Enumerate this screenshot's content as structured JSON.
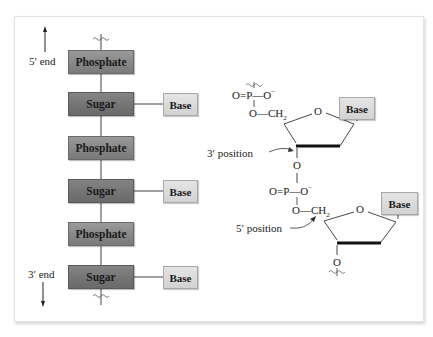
{
  "diagram": {
    "left_panel": {
      "end_labels": {
        "top": "5′ end",
        "bottom": "3′ end"
      },
      "units": [
        {
          "type": "phosphate",
          "label": "Phosphate"
        },
        {
          "type": "sugar",
          "label": "Sugar",
          "base": "Base"
        },
        {
          "type": "phosphate",
          "label": "Phosphate"
        },
        {
          "type": "sugar",
          "label": "Sugar",
          "base": "Base"
        },
        {
          "type": "phosphate",
          "label": "Phosphate"
        },
        {
          "type": "sugar",
          "label": "Sugar",
          "base": "Base"
        }
      ]
    },
    "right_panel": {
      "nucleotide_1": {
        "phosphate": {
          "double_o": "O",
          "p": "P",
          "o_minus": "O",
          "minus": "−"
        },
        "linker_o": "O",
        "ch2": "CH",
        "ch2_sub": "2",
        "ring_o": "O",
        "base": "Base",
        "three_prime_o": "O"
      },
      "nucleotide_2": {
        "phosphate": {
          "double_o": "O",
          "p": "P",
          "o_minus": "O",
          "minus": "−"
        },
        "linker_o": "O",
        "ch2": "CH",
        "ch2_sub": "2",
        "ring_o": "O",
        "base": "Base",
        "three_prime_o": "O"
      },
      "annotations": {
        "three_prime": "3′ position",
        "five_prime": "5′ position"
      }
    },
    "colors": {
      "phosphate_box": "#878787",
      "sugar_box": "#747474",
      "base_box": "#d8d8d8",
      "line": "#333333"
    }
  }
}
